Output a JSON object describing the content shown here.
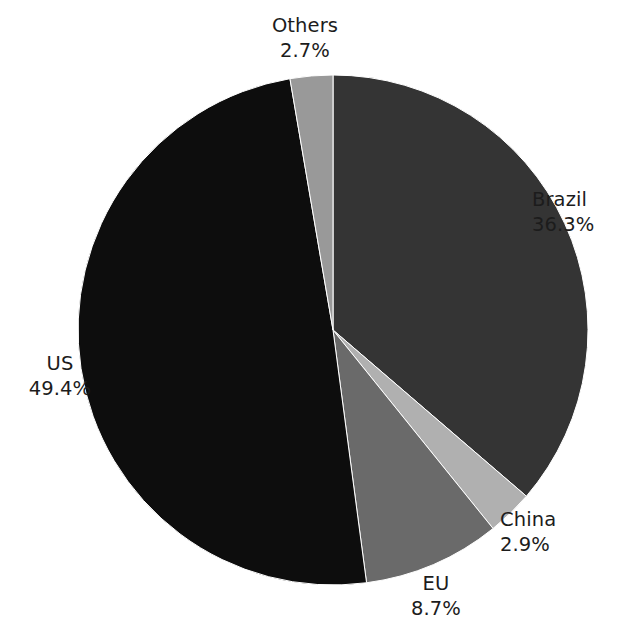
{
  "chart_data": {
    "type": "pie",
    "title": "",
    "subtitle": "",
    "xlabel": "",
    "ylabel": "",
    "legend_position": "none",
    "grid": false,
    "units": "percent",
    "start_angle_deg": 0,
    "direction": "clockwise",
    "categories": [
      "Brazil",
      "China",
      "EU",
      "US",
      "Others"
    ],
    "values": [
      36.3,
      2.9,
      8.7,
      49.4,
      2.7
    ],
    "colors": [
      "#343434",
      "#b0b0b0",
      "#6a6a6a",
      "#0d0d0d",
      "#999999"
    ],
    "slices": [
      {
        "label": "Brazil",
        "value": 36.3,
        "value_text": "36.3%",
        "color": "#343434"
      },
      {
        "label": "China",
        "value": 2.9,
        "value_text": "2.9%",
        "color": "#b0b0b0"
      },
      {
        "label": "EU",
        "value": 8.7,
        "value_text": "8.7%",
        "color": "#6a6a6a"
      },
      {
        "label": "US",
        "value": 49.4,
        "value_text": "49.4%",
        "color": "#0d0d0d"
      },
      {
        "label": "Others",
        "value": 2.7,
        "value_text": "2.7%",
        "color": "#999999"
      }
    ]
  },
  "labels": {
    "others": {
      "name": "Others",
      "value": "2.7%"
    },
    "brazil": {
      "name": "Brazil",
      "value": "36.3%"
    },
    "china": {
      "name": "China",
      "value": "2.9%"
    },
    "eu": {
      "name": "EU",
      "value": "8.7%"
    },
    "us": {
      "name": "US",
      "value": "49.4%"
    }
  },
  "geometry": {
    "center_x": 333,
    "center_y": 330,
    "radius": 255
  }
}
